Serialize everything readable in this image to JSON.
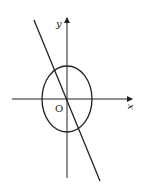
{
  "diagram": {
    "axes": {
      "x_label": "x",
      "y_label": "y",
      "origin_label": "O"
    },
    "shapes": [
      {
        "type": "ellipse",
        "center": [
          0,
          0
        ],
        "semi_axis_x": 25,
        "semi_axis_y": 33
      },
      {
        "type": "line",
        "through_origin": true,
        "slope_direction": "negative"
      }
    ],
    "colors": {
      "stroke": "#222222",
      "background": "#ffffff"
    }
  }
}
